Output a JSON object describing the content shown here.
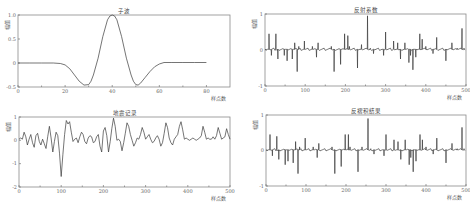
{
  "chart_data": [
    {
      "id": "wavelet",
      "type": "line",
      "title": "子波",
      "xlabel": "样点数",
      "ylabel": "幅值",
      "xlim": [
        0,
        90
      ],
      "ylim": [
        -0.5,
        1.0
      ],
      "xticks": [
        0,
        20,
        40,
        60,
        80
      ],
      "yticks": [
        -0.5,
        0,
        0.5,
        1.0
      ],
      "ytick_labels": [
        "-0.5",
        "0",
        "0.5",
        "1.0"
      ],
      "grid": false,
      "frame": {
        "x": 18,
        "y": 15,
        "w": 212,
        "h": 72
      },
      "x": [
        0,
        5,
        10,
        15,
        18,
        20,
        22,
        24,
        26,
        28,
        30,
        31,
        32,
        34,
        36,
        38,
        39,
        40,
        41,
        42,
        44,
        46,
        48,
        49,
        50,
        51,
        52,
        54,
        56,
        58,
        60,
        62,
        65,
        70,
        75,
        80
      ],
      "y": [
        0,
        0,
        0,
        0,
        -0.01,
        -0.04,
        -0.12,
        -0.25,
        -0.38,
        -0.46,
        -0.45,
        -0.38,
        -0.25,
        0.1,
        0.55,
        0.9,
        0.98,
        1.0,
        0.98,
        0.9,
        0.55,
        0.1,
        -0.25,
        -0.38,
        -0.45,
        -0.46,
        -0.42,
        -0.3,
        -0.18,
        -0.08,
        -0.02,
        0.01,
        0.01,
        0.01,
        0.01,
        0.01
      ]
    },
    {
      "id": "seismic-record",
      "type": "line",
      "title": "地震记录",
      "xlabel": "样点数",
      "ylabel": "幅值",
      "xlim": [
        0,
        500
      ],
      "ylim": [
        -2,
        1
      ],
      "xticks": [
        0,
        100,
        200,
        300,
        400,
        500
      ],
      "yticks": [
        -2,
        -1,
        0,
        1
      ],
      "ytick_labels": [
        "-2",
        "-1",
        "0",
        "1"
      ],
      "grid": false,
      "frame": {
        "x": 19,
        "y": 117,
        "w": 211,
        "h": 70
      },
      "x": [
        0,
        4,
        8,
        12,
        16,
        20,
        24,
        28,
        32,
        36,
        40,
        44,
        48,
        52,
        56,
        60,
        64,
        68,
        72,
        76,
        80,
        84,
        88,
        92,
        96,
        100,
        104,
        108,
        112,
        116,
        120,
        124,
        128,
        132,
        136,
        140,
        144,
        148,
        152,
        156,
        160,
        164,
        168,
        172,
        176,
        180,
        184,
        188,
        192,
        196,
        200,
        204,
        208,
        212,
        216,
        220,
        224,
        228,
        232,
        236,
        240,
        244,
        248,
        252,
        256,
        260,
        264,
        268,
        272,
        276,
        280,
        284,
        288,
        292,
        296,
        300,
        304,
        308,
        312,
        316,
        320,
        324,
        328,
        332,
        336,
        340,
        344,
        348,
        352,
        356,
        360,
        364,
        368,
        372,
        376,
        380,
        384,
        388,
        392,
        396,
        400,
        404,
        408,
        412,
        416,
        420,
        424,
        428,
        432,
        436,
        440,
        444,
        448,
        452,
        456,
        460,
        464,
        468,
        472,
        476,
        480,
        484,
        488,
        492,
        496,
        500
      ],
      "y": [
        0.05,
        0.1,
        0.05,
        0.35,
        0.15,
        -0.2,
        0.05,
        0.25,
        -0.1,
        -0.3,
        0.2,
        0.3,
        -0.05,
        -0.2,
        0.05,
        -0.15,
        -0.35,
        0.15,
        0.6,
        0.1,
        -0.5,
        -0.05,
        0.35,
        0.2,
        -0.55,
        -1.55,
        -0.6,
        0.25,
        0.85,
        0.7,
        0.8,
        0.35,
        -0.05,
        0.05,
        0.1,
        -0.1,
        0.15,
        0.35,
        0.25,
        -0.05,
        -0.15,
        0.1,
        0.2,
        0.15,
        -0.1,
        -0.05,
        0.15,
        0.25,
        -0.25,
        -0.5,
        0.4,
        0.55,
        0.2,
        -0.5,
        -0.05,
        0.5,
        0.95,
        0.6,
        0.0,
        0.05,
        -0.05,
        -0.45,
        -0.1,
        0.3,
        0.75,
        0.6,
        0.25,
        0.0,
        -0.25,
        -0.1,
        0.1,
        0.05,
        0.25,
        0.55,
        0.35,
        0.05,
        0.15,
        0.25,
        0.05,
        -0.1,
        -0.05,
        0.1,
        0.2,
        0.05,
        -0.25,
        -0.1,
        0.3,
        0.75,
        0.55,
        0.1,
        -0.1,
        -0.2,
        0.05,
        0.15,
        0.25,
        0.6,
        0.8,
        0.45,
        0.05,
        0.1,
        0.05,
        0.0,
        0.05,
        0.1,
        0.05,
        0.0,
        0.05,
        0.1,
        0.2,
        0.6,
        0.35,
        0.05,
        0.1,
        0.05,
        0.05,
        0.15,
        0.05,
        0.2,
        0.55,
        0.3,
        0.05,
        0.1,
        0.15,
        0.5,
        0.25,
        0.05
      ]
    },
    {
      "id": "reflection-coefficient",
      "type": "line",
      "title": "反射系数",
      "xlabel": "样点数",
      "ylabel": "幅值",
      "xlim": [
        0,
        500
      ],
      "ylim": [
        -1,
        1
      ],
      "xticks": [
        0,
        100,
        200,
        300,
        400,
        500
      ],
      "yticks": [
        -1,
        0,
        1
      ],
      "ytick_labels": [
        "-1",
        "0",
        "1"
      ],
      "grid": false,
      "frame": {
        "x": 265,
        "y": 14,
        "w": 201,
        "h": 72
      },
      "spikes": [
        [
          10,
          0.45
        ],
        [
          16,
          -0.15
        ],
        [
          27,
          0.45
        ],
        [
          32,
          -0.25
        ],
        [
          48,
          -0.15
        ],
        [
          55,
          -0.3
        ],
        [
          68,
          -0.25
        ],
        [
          74,
          0.2
        ],
        [
          80,
          -0.6
        ],
        [
          84,
          0.1
        ],
        [
          98,
          0.25
        ],
        [
          118,
          0.1
        ],
        [
          128,
          -0.2
        ],
        [
          132,
          0.2
        ],
        [
          165,
          0.1
        ],
        [
          172,
          -0.6
        ],
        [
          188,
          -0.4
        ],
        [
          198,
          0.45
        ],
        [
          206,
          0.4
        ],
        [
          210,
          0.1
        ],
        [
          230,
          -0.5
        ],
        [
          240,
          0.15
        ],
        [
          255,
          0.95
        ],
        [
          262,
          0.05
        ],
        [
          270,
          -0.1
        ],
        [
          295,
          -0.15
        ],
        [
          300,
          0.5
        ],
        [
          320,
          0.25
        ],
        [
          330,
          0.2
        ],
        [
          337,
          -0.25
        ],
        [
          348,
          0.2
        ],
        [
          358,
          -0.35
        ],
        [
          362,
          -0.15
        ],
        [
          368,
          -0.55
        ],
        [
          375,
          -0.2
        ],
        [
          385,
          0.45
        ],
        [
          391,
          0.3
        ],
        [
          400,
          0.1
        ],
        [
          418,
          -0.1
        ],
        [
          427,
          0.35
        ],
        [
          450,
          -0.3
        ],
        [
          465,
          0.2
        ],
        [
          478,
          0.05
        ],
        [
          490,
          0.6
        ],
        [
          495,
          0.05
        ]
      ]
    },
    {
      "id": "deconvolution-result",
      "type": "line",
      "title": "反褶积结果",
      "xlabel": "样点数",
      "ylabel": "幅值",
      "xlim": [
        0,
        500
      ],
      "ylim": [
        -1,
        1
      ],
      "xticks": [
        0,
        100,
        200,
        300,
        400,
        500
      ],
      "yticks": [
        -1,
        0,
        1
      ],
      "ytick_labels": [
        "-1",
        "0",
        "1"
      ],
      "grid": false,
      "frame": {
        "x": 266,
        "y": 115,
        "w": 200,
        "h": 71
      },
      "spikes": [
        [
          10,
          0.45
        ],
        [
          16,
          -0.15
        ],
        [
          27,
          0.4
        ],
        [
          32,
          -0.25
        ],
        [
          48,
          -0.4
        ],
        [
          55,
          -0.3
        ],
        [
          68,
          -0.35
        ],
        [
          74,
          0.25
        ],
        [
          80,
          -0.65
        ],
        [
          84,
          0.1
        ],
        [
          98,
          0.35
        ],
        [
          118,
          0.1
        ],
        [
          128,
          -0.2
        ],
        [
          132,
          0.2
        ],
        [
          165,
          0.1
        ],
        [
          172,
          -0.65
        ],
        [
          188,
          -0.45
        ],
        [
          198,
          0.45
        ],
        [
          206,
          0.45
        ],
        [
          210,
          0.1
        ],
        [
          230,
          -0.6
        ],
        [
          240,
          0.1
        ],
        [
          255,
          0.9
        ],
        [
          262,
          0.05
        ],
        [
          270,
          -0.1
        ],
        [
          295,
          -0.15
        ],
        [
          300,
          0.45
        ],
        [
          320,
          0.3
        ],
        [
          330,
          0.25
        ],
        [
          337,
          -0.25
        ],
        [
          348,
          0.3
        ],
        [
          358,
          -0.4
        ],
        [
          362,
          -0.2
        ],
        [
          368,
          -0.6
        ],
        [
          375,
          -0.3
        ],
        [
          385,
          0.45
        ],
        [
          391,
          0.3
        ],
        [
          400,
          0.1
        ],
        [
          418,
          -0.1
        ],
        [
          427,
          0.35
        ],
        [
          450,
          -0.35
        ],
        [
          465,
          0.2
        ],
        [
          478,
          0.05
        ],
        [
          490,
          0.65
        ],
        [
          495,
          0.05
        ]
      ]
    }
  ]
}
